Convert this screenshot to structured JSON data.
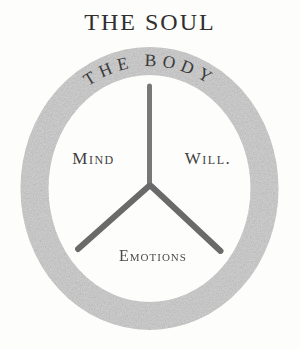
{
  "page": {
    "background": "#fdfdfb"
  },
  "diagram": {
    "title": "THE SOUL",
    "ring_label": "THE BODY",
    "sections": {
      "left_label": "Mind",
      "right_label": "Will.",
      "bottom_label": "Emotions"
    },
    "colors": {
      "ring": "#c9c9c9",
      "spoke_vertical": "#787878",
      "spoke_diagonal": "#6a6a6a",
      "title_text": "#2f2f2f",
      "ring_label_text": "#3a3a3a",
      "section_label_text": "#3f3f3f",
      "bottom_label_text": "#4a4a4a"
    }
  }
}
